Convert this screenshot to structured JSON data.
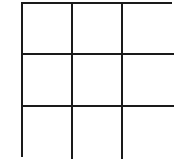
{
  "diagram": {
    "type": "grid",
    "rows": 3,
    "columns": 3,
    "line_color": "#1a1a1a",
    "background_color": "#ffffff",
    "cells": [
      {
        "row": 1,
        "col": 1,
        "label": ""
      },
      {
        "row": 1,
        "col": 2,
        "label": ""
      },
      {
        "row": 1,
        "col": 3,
        "label": ""
      },
      {
        "row": 2,
        "col": 1,
        "label": ""
      },
      {
        "row": 2,
        "col": 2,
        "label": ""
      },
      {
        "row": 2,
        "col": 3,
        "label": ""
      },
      {
        "row": 3,
        "col": 1,
        "label": ""
      },
      {
        "row": 3,
        "col": 2,
        "label": ""
      },
      {
        "row": 3,
        "col": 3,
        "label": ""
      }
    ]
  }
}
